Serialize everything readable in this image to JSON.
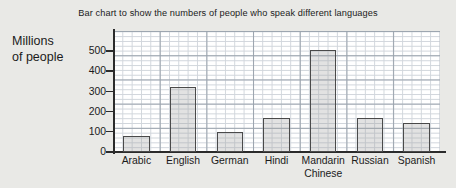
{
  "chart_data": {
    "type": "bar",
    "title": "Bar chart to show the numbers of people who speak different languages",
    "xlabel": "",
    "ylabel": "Millions of people",
    "ylabel_lines": [
      "Millions",
      "of people"
    ],
    "categories": [
      "Arabic",
      "English",
      "German",
      "Hindi",
      "Mandarin Chinese",
      "Russian",
      "Spanish"
    ],
    "category_lines": [
      [
        "Arabic"
      ],
      [
        "English"
      ],
      [
        "German"
      ],
      [
        "Hindi"
      ],
      [
        "Mandarin",
        "Chinese"
      ],
      [
        "Russian"
      ],
      [
        "Spanish"
      ]
    ],
    "values": [
      80,
      320,
      100,
      170,
      505,
      170,
      145
    ],
    "ylim": [
      0,
      600
    ],
    "y_ticks": [
      0,
      100,
      200,
      300,
      400,
      500
    ],
    "y_tick_labels": [
      "0",
      "100",
      "200",
      "300",
      "400",
      "500"
    ],
    "grid": true,
    "grid_minor_step": 20,
    "grid_major_step": 100,
    "legend": false,
    "legend_position": "none",
    "colors": {
      "page_background": "#e9e9e6",
      "plot_background": "#ffffff",
      "bar_fill": "#d6d6d6",
      "bar_outline": "#4a4a4a",
      "axis": "#2b2b2b",
      "grid_minor": "#c9cfd6",
      "grid_major": "#9aa3ad",
      "text": "#1b1b1b"
    }
  }
}
